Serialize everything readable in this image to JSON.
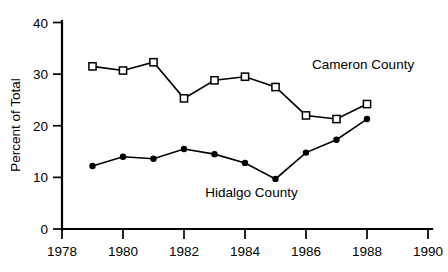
{
  "chart_data": {
    "type": "line",
    "title": "",
    "xlabel": "",
    "ylabel": "Percent of Total",
    "xlim": [
      1978,
      1990
    ],
    "ylim": [
      0,
      40
    ],
    "grid": false,
    "legend_position": "inline-annotations",
    "x": [
      1979,
      1980,
      1981,
      1982,
      1983,
      1984,
      1985,
      1986,
      1987,
      1988
    ],
    "xticks": [
      "1978",
      "1980",
      "1982",
      "1984",
      "1986",
      "1988",
      "1990"
    ],
    "xtick_values": [
      1978,
      1980,
      1982,
      1984,
      1986,
      1988,
      1990
    ],
    "yticks": [
      "0",
      "10",
      "20",
      "30",
      "40"
    ],
    "ytick_values": [
      0,
      10,
      20,
      30,
      40
    ],
    "series": [
      {
        "name": "Cameron County",
        "marker": "open-square",
        "label_x": 1986.2,
        "label_y": 31.0,
        "values": [
          31.5,
          30.7,
          32.3,
          25.3,
          28.8,
          29.5,
          27.5,
          22.0,
          21.3,
          24.2
        ]
      },
      {
        "name": "Hidalgo County",
        "marker": "filled-circle",
        "label_x": 1982.7,
        "label_y": 6.2,
        "values": [
          12.2,
          14.0,
          13.6,
          15.5,
          14.5,
          12.8,
          9.7,
          14.8,
          17.3,
          21.3
        ]
      }
    ]
  },
  "colors": {
    "line": "#000000",
    "axis": "#000000",
    "background": "#ffffff"
  }
}
